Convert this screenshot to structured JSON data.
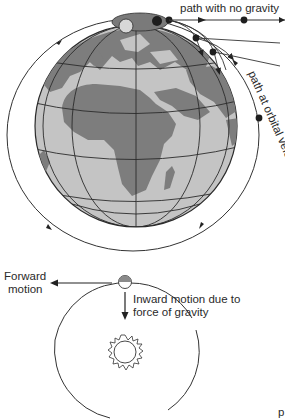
{
  "diagram": {
    "top": {
      "labels": {
        "no_gravity": "path with no gravity",
        "orbital_velocity": "path at orbital velocity"
      },
      "colors": {
        "ocean": "#c4c4c4",
        "land": "#7d7d7d",
        "grid": "#2b2b2b",
        "orbit": "#333333",
        "ball": "#1e1e1e",
        "cannon": "#7a7a7a"
      }
    },
    "bottom": {
      "labels": {
        "forward_line1": "Forward",
        "forward_line2": "motion",
        "inward_line1": "Inward motion due to",
        "inward_line2": "force of gravity",
        "corner": "p"
      }
    }
  }
}
